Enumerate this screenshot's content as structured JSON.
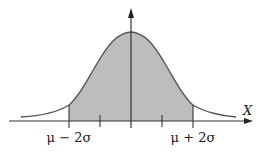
{
  "diagram": {
    "type": "normal-distribution",
    "axis_label_x": "X",
    "left_bound_label": "μ − 2σ",
    "right_bound_label": "μ + 2σ",
    "shaded_region": "between μ − 2σ and μ + 2σ",
    "tick_marks": [
      "μ − 2σ",
      "μ − σ",
      "μ",
      "μ + σ",
      "μ + 2σ"
    ],
    "colors": {
      "curve": "#555555",
      "shade": "#bdbdbd",
      "axis": "#333333"
    }
  }
}
